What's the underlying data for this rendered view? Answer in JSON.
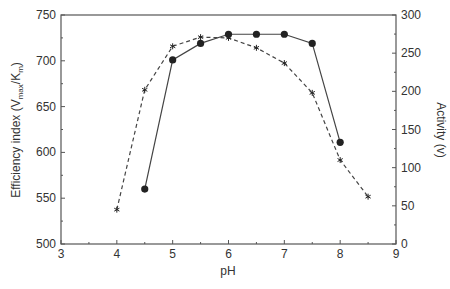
{
  "chart_data": {
    "type": "line",
    "title": "",
    "xlabel": "pH",
    "ylabel_left": "Efficiency index (V_max/K_m)",
    "ylabel_left_parts": {
      "main": "Efficiency index (V",
      "sub1": "max",
      "mid": "/K",
      "sub2": "m",
      "end": ")"
    },
    "ylabel_right": "Activity (v)",
    "xlim": [
      3,
      9
    ],
    "ylim_left": [
      500,
      750
    ],
    "ylim_right": [
      0,
      300
    ],
    "x_ticks": [
      3,
      4,
      5,
      6,
      7,
      8,
      9
    ],
    "y_left_ticks": [
      500,
      550,
      600,
      650,
      700,
      750
    ],
    "y_right_ticks": [
      0,
      50,
      100,
      150,
      200,
      250,
      300
    ],
    "grid": false,
    "legend": null,
    "series": [
      {
        "name": "Efficiency index",
        "axis": "left",
        "style": "solid",
        "marker": "filled-circle",
        "x": [
          4.5,
          5,
          5.5,
          6,
          6.5,
          7,
          7.5,
          8
        ],
        "values": [
          560,
          701,
          719,
          729,
          729,
          729,
          719,
          611
        ]
      },
      {
        "name": "Activity",
        "axis": "right",
        "style": "dashed",
        "marker": "star",
        "x": [
          4,
          4.5,
          5,
          5.5,
          6,
          6.5,
          7,
          7.5,
          8,
          8.5
        ],
        "values": [
          45,
          202,
          259,
          271,
          270,
          257,
          237,
          198,
          110,
          62
        ]
      }
    ]
  },
  "colors": {
    "axis": "#555555",
    "line": "#444444",
    "marker": "#222222"
  }
}
